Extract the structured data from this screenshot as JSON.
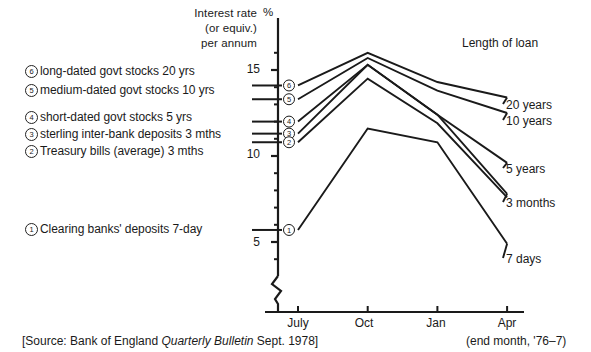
{
  "axis_title": {
    "line1": "Interest rate",
    "line2": "(or equiv.)",
    "line3": "per annum",
    "unit": "%"
  },
  "legend_heading": "Length of loan",
  "footer": {
    "source_prefix": "[Source: Bank of England ",
    "source_italic": "Quarterly Bulletin",
    "source_suffix": " Sept. 1978]",
    "note": "(end month, '76–7)"
  },
  "key_items": [
    {
      "marker": "⑥",
      "num": "6",
      "label": "long-dated govt stocks 20 yrs"
    },
    {
      "marker": "⑤",
      "num": "5",
      "label": "medium-dated govt stocks 10 yrs"
    },
    {
      "marker": "④",
      "num": "4",
      "label": "short-dated govt stocks 5 yrs"
    },
    {
      "marker": "③",
      "num": "3",
      "label": "sterling inter-bank deposits 3 mths"
    },
    {
      "marker": "②",
      "num": "2",
      "label": "Treasury bills (average) 3 mths"
    },
    {
      "marker": "①",
      "num": "1",
      "label": "Clearing banks' deposits 7-day"
    }
  ],
  "chart_data": {
    "type": "line",
    "title": "",
    "xlabel": "",
    "ylabel": "Interest rate (or equiv.) per annum",
    "yunit": "%",
    "categories": [
      "July",
      "Oct",
      "Jan",
      "Apr"
    ],
    "x_tick_labels": [
      "July",
      "Oct",
      "Jan",
      "Apr"
    ],
    "y_tick_labels": [
      "15",
      "10",
      "5"
    ],
    "y_tick_values": [
      15,
      10,
      5
    ],
    "ylim": [
      3.6,
      16.8
    ],
    "y_minor_step": 1,
    "grid": false,
    "axis_break": true,
    "legend_position": "right-of-lines",
    "series": [
      {
        "key": "6",
        "name": "20 years",
        "key_label": "long-dated govt stocks 20 yrs",
        "end_label": "20 years",
        "values": [
          14.1,
          16.0,
          14.3,
          13.4
        ]
      },
      {
        "key": "5",
        "name": "10 years",
        "key_label": "medium-dated govt stocks 10 yrs",
        "end_label": "10 years",
        "values": [
          13.3,
          15.7,
          13.8,
          12.5
        ]
      },
      {
        "key": "4",
        "name": "5 years",
        "key_label": "short-dated govt stocks 5 yrs",
        "end_label": "5 years",
        "values": [
          12.0,
          15.3,
          12.4,
          9.6
        ]
      },
      {
        "key": "3",
        "name": "3 months",
        "key_label": "sterling inter-bank deposits 3 mths",
        "end_label": "3 months",
        "values": [
          11.3,
          15.3,
          12.4,
          7.8
        ]
      },
      {
        "key": "2",
        "name": "3 months (Treasury bills)",
        "key_label": "Treasury bills (average) 3 mths",
        "end_label": "",
        "values": [
          10.8,
          14.5,
          11.9,
          7.6
        ]
      },
      {
        "key": "1",
        "name": "7 days",
        "key_label": "Clearing banks' deposits 7-day",
        "end_label": "7 days",
        "values": [
          5.7,
          11.6,
          10.8,
          4.9
        ]
      }
    ]
  }
}
